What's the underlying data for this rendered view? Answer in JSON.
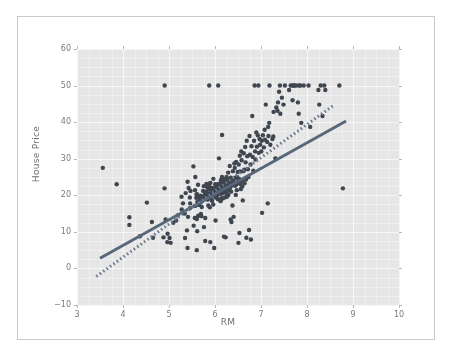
{
  "figure": {
    "background_color": "#ffffff",
    "frame_border_color": "#c9c9c9",
    "plot_background_color": "#e6e6e6",
    "gridline_color": "#f2f2f2",
    "tick_label_color": "#7a7a7a",
    "axis_label_color": "#6d6d6d"
  },
  "chart_data": {
    "type": "scatter",
    "title": "",
    "xlabel": "RM",
    "ylabel": "House Price",
    "xlim": [
      3,
      10
    ],
    "ylim": [
      -10,
      60
    ],
    "xticks": [
      3,
      4,
      5,
      6,
      7,
      8,
      9,
      10
    ],
    "yticks": [
      -10,
      0,
      10,
      20,
      30,
      40,
      50,
      60
    ],
    "xtick_labels": [
      "3",
      "4",
      "5",
      "6",
      "7",
      "8",
      "9",
      "10"
    ],
    "ytick_labels": [
      "-10",
      "0",
      "10",
      "20",
      "30",
      "40",
      "50",
      "60"
    ],
    "grid": true,
    "legend": "none",
    "marker": {
      "shape": "circle",
      "color": "#3f4650",
      "size": 2.2
    },
    "series": [
      {
        "name": "observations",
        "kind": "scatter",
        "points": [
          [
            3.561,
            27.5
          ],
          [
            3.863,
            23.0
          ],
          [
            4.138,
            14.0
          ],
          [
            4.138,
            11.9
          ],
          [
            4.368,
            8.8
          ],
          [
            4.519,
            18.0
          ],
          [
            4.628,
            12.7
          ],
          [
            4.652,
            8.4
          ],
          [
            4.88,
            8.5
          ],
          [
            4.903,
            21.9
          ],
          [
            4.906,
            50.0
          ],
          [
            4.926,
            13.4
          ],
          [
            4.963,
            7.2
          ],
          [
            4.97,
            9.5
          ],
          [
            5.012,
            8.3
          ],
          [
            5.036,
            7.0
          ],
          [
            5.093,
            12.5
          ],
          [
            5.155,
            13.1
          ],
          [
            5.19,
            14.5
          ],
          [
            5.272,
            19.6
          ],
          [
            5.277,
            16.1
          ],
          [
            5.304,
            17.8
          ],
          [
            5.344,
            15.0
          ],
          [
            5.349,
            8.3
          ],
          [
            5.362,
            20.6
          ],
          [
            5.39,
            10.4
          ],
          [
            5.403,
            5.6
          ],
          [
            5.404,
            23.7
          ],
          [
            5.414,
            14.1
          ],
          [
            5.427,
            22.0
          ],
          [
            5.453,
            19.4
          ],
          [
            5.456,
            16.5
          ],
          [
            5.46,
            17.8
          ],
          [
            5.468,
            21.2
          ],
          [
            5.531,
            27.9
          ],
          [
            5.536,
            11.7
          ],
          [
            5.56,
            13.8
          ],
          [
            5.565,
            21.4
          ],
          [
            5.569,
            17.1
          ],
          [
            5.572,
            25.0
          ],
          [
            5.593,
            19.3
          ],
          [
            5.599,
            20.2
          ],
          [
            5.602,
            13.9
          ],
          [
            5.604,
            5.0
          ],
          [
            5.605,
            13.5
          ],
          [
            5.608,
            20.3
          ],
          [
            5.613,
            10.2
          ],
          [
            5.617,
            18.2
          ],
          [
            5.627,
            19.4
          ],
          [
            5.631,
            22.9
          ],
          [
            5.637,
            14.4
          ],
          [
            5.647,
            17.4
          ],
          [
            5.66,
            17.4
          ],
          [
            5.682,
            18.9
          ],
          [
            5.683,
            19.9
          ],
          [
            5.693,
            14.9
          ],
          [
            5.701,
            18.2
          ],
          [
            5.705,
            14.3
          ],
          [
            5.708,
            19.6
          ],
          [
            5.713,
            16.8
          ],
          [
            5.727,
            18.5
          ],
          [
            5.736,
            19.1
          ],
          [
            5.741,
            21.2
          ],
          [
            5.757,
            22.5
          ],
          [
            5.76,
            11.3
          ],
          [
            5.762,
            19.8
          ],
          [
            5.786,
            20.4
          ],
          [
            5.787,
            7.5
          ],
          [
            5.789,
            13.8
          ],
          [
            5.794,
            19.0
          ],
          [
            5.8,
            20.5
          ],
          [
            5.803,
            21.0
          ],
          [
            5.813,
            23.1
          ],
          [
            5.817,
            20.1
          ],
          [
            5.834,
            22.2
          ],
          [
            5.837,
            18.8
          ],
          [
            5.854,
            17.2
          ],
          [
            5.856,
            21.7
          ],
          [
            5.868,
            19.3
          ],
          [
            5.872,
            22.6
          ],
          [
            5.874,
            50.0
          ],
          [
            5.876,
            20.6
          ],
          [
            5.879,
            23.2
          ],
          [
            5.885,
            21.7
          ],
          [
            5.888,
            16.7
          ],
          [
            5.891,
            19.5
          ],
          [
            5.895,
            20.1
          ],
          [
            5.898,
            7.2
          ],
          [
            5.9,
            23.4
          ],
          [
            5.914,
            20.6
          ],
          [
            5.926,
            18.7
          ],
          [
            5.935,
            22.0
          ],
          [
            5.936,
            18.5
          ],
          [
            5.949,
            21.4
          ],
          [
            5.951,
            20.9
          ],
          [
            5.96,
            19.9
          ],
          [
            5.961,
            21.2
          ],
          [
            5.962,
            17.5
          ],
          [
            5.963,
            21.0
          ],
          [
            5.965,
            24.5
          ],
          [
            5.976,
            21.8
          ],
          [
            5.983,
            5.6
          ],
          [
            5.987,
            20.3
          ],
          [
            6.003,
            20.5
          ],
          [
            6.004,
            23.0
          ],
          [
            6.006,
            22.0
          ],
          [
            6.009,
            20.9
          ],
          [
            6.012,
            13.1
          ],
          [
            6.015,
            19.4
          ],
          [
            6.02,
            21.6
          ],
          [
            6.023,
            22.9
          ],
          [
            6.03,
            19.5
          ],
          [
            6.04,
            21.0
          ],
          [
            6.047,
            20.0
          ],
          [
            6.059,
            21.7
          ],
          [
            6.064,
            18.9
          ],
          [
            6.065,
            22.1
          ],
          [
            6.07,
            50.0
          ],
          [
            6.078,
            23.1
          ],
          [
            6.082,
            20.4
          ],
          [
            6.086,
            30.1
          ],
          [
            6.092,
            21.9
          ],
          [
            6.096,
            22.3
          ],
          [
            6.108,
            20.6
          ],
          [
            6.114,
            21.4
          ],
          [
            6.121,
            18.4
          ],
          [
            6.127,
            23.3
          ],
          [
            6.129,
            24.2
          ],
          [
            6.13,
            22.2
          ],
          [
            6.137,
            20.4
          ],
          [
            6.14,
            19.2
          ],
          [
            6.142,
            22.8
          ],
          [
            6.145,
            21.1
          ],
          [
            6.152,
            25.0
          ],
          [
            6.154,
            36.5
          ],
          [
            6.162,
            19.1
          ],
          [
            6.167,
            22.0
          ],
          [
            6.172,
            20.7
          ],
          [
            6.174,
            23.8
          ],
          [
            6.182,
            21.2
          ],
          [
            6.185,
            24.4
          ],
          [
            6.19,
            20.9
          ],
          [
            6.193,
            22.6
          ],
          [
            6.195,
            8.7
          ],
          [
            6.2,
            21.9
          ],
          [
            6.208,
            23.1
          ],
          [
            6.211,
            19.4
          ],
          [
            6.216,
            22.4
          ],
          [
            6.219,
            20.8
          ],
          [
            6.224,
            24.0
          ],
          [
            6.229,
            21.5
          ],
          [
            6.232,
            8.5
          ],
          [
            6.24,
            23.3
          ],
          [
            6.245,
            22.1
          ],
          [
            6.25,
            25.0
          ],
          [
            6.254,
            20.6
          ],
          [
            6.258,
            19.6
          ],
          [
            6.263,
            22.4
          ],
          [
            6.268,
            21.8
          ],
          [
            6.273,
            23.9
          ],
          [
            6.279,
            22.0
          ],
          [
            6.286,
            26.2
          ],
          [
            6.29,
            20.1
          ],
          [
            6.297,
            24.4
          ],
          [
            6.302,
            23.1
          ],
          [
            6.312,
            22.5
          ],
          [
            6.315,
            21.4
          ],
          [
            6.32,
            28.0
          ],
          [
            6.326,
            23.7
          ],
          [
            6.333,
            22.2
          ],
          [
            6.34,
            13.4
          ],
          [
            6.345,
            24.8
          ],
          [
            6.35,
            21.0
          ],
          [
            6.358,
            12.7
          ],
          [
            6.362,
            23.5
          ],
          [
            6.372,
            22.8
          ],
          [
            6.38,
            17.2
          ],
          [
            6.389,
            26.6
          ],
          [
            6.395,
            24.1
          ],
          [
            6.402,
            22.9
          ],
          [
            6.405,
            14.1
          ],
          [
            6.416,
            23.3
          ],
          [
            6.421,
            28.7
          ],
          [
            6.431,
            27.5
          ],
          [
            6.437,
            22.6
          ],
          [
            6.442,
            24.8
          ],
          [
            6.452,
            20.1
          ],
          [
            6.46,
            29.1
          ],
          [
            6.47,
            23.0
          ],
          [
            6.474,
            21.4
          ],
          [
            6.482,
            25.0
          ],
          [
            6.492,
            26.4
          ],
          [
            6.501,
            23.9
          ],
          [
            6.51,
            7.0
          ],
          [
            6.516,
            28.4
          ],
          [
            6.525,
            24.5
          ],
          [
            6.531,
            9.7
          ],
          [
            6.54,
            30.8
          ],
          [
            6.545,
            26.5
          ],
          [
            6.552,
            23.1
          ],
          [
            6.563,
            21.7
          ],
          [
            6.57,
            32.0
          ],
          [
            6.579,
            29.6
          ],
          [
            6.585,
            24.0
          ],
          [
            6.593,
            22.4
          ],
          [
            6.604,
            18.6
          ],
          [
            6.616,
            26.6
          ],
          [
            6.625,
            31.5
          ],
          [
            6.635,
            27.0
          ],
          [
            6.642,
            23.3
          ],
          [
            6.656,
            33.2
          ],
          [
            6.665,
            29.0
          ],
          [
            6.673,
            24.3
          ],
          [
            6.682,
            8.4
          ],
          [
            6.69,
            34.9
          ],
          [
            6.701,
            30.7
          ],
          [
            6.715,
            27.1
          ],
          [
            6.728,
            25.0
          ],
          [
            6.74,
            10.5
          ],
          [
            6.75,
            36.2
          ],
          [
            6.76,
            31.1
          ],
          [
            6.772,
            28.4
          ],
          [
            6.78,
            7.9
          ],
          [
            6.794,
            33.4
          ],
          [
            6.81,
            41.7
          ],
          [
            6.82,
            30.5
          ],
          [
            6.833,
            26.7
          ],
          [
            6.849,
            34.9
          ],
          [
            6.861,
            50.0
          ],
          [
            6.871,
            32.0
          ],
          [
            6.88,
            29.8
          ],
          [
            6.898,
            37.2
          ],
          [
            6.91,
            33.3
          ],
          [
            6.93,
            36.4
          ],
          [
            6.943,
            50.0
          ],
          [
            6.951,
            31.6
          ],
          [
            6.968,
            35.4
          ],
          [
            6.98,
            33.8
          ],
          [
            7.007,
            32.0
          ],
          [
            7.016,
            34.9
          ],
          [
            7.024,
            15.2
          ],
          [
            7.041,
            36.4
          ],
          [
            7.061,
            33.1
          ],
          [
            7.079,
            37.9
          ],
          [
            7.088,
            35.2
          ],
          [
            7.104,
            44.8
          ],
          [
            7.135,
            34.6
          ],
          [
            7.147,
            17.8
          ],
          [
            7.155,
            38.7
          ],
          [
            7.163,
            36.2
          ],
          [
            7.178,
            39.8
          ],
          [
            7.185,
            50.0
          ],
          [
            7.203,
            33.8
          ],
          [
            7.249,
            35.4
          ],
          [
            7.267,
            36.1
          ],
          [
            7.274,
            42.8
          ],
          [
            7.313,
            30.1
          ],
          [
            7.333,
            44.0
          ],
          [
            7.358,
            43.1
          ],
          [
            7.37,
            45.4
          ],
          [
            7.393,
            48.3
          ],
          [
            7.412,
            50.0
          ],
          [
            7.42,
            42.3
          ],
          [
            7.454,
            46.7
          ],
          [
            7.489,
            44.8
          ],
          [
            7.52,
            50.0
          ],
          [
            7.61,
            48.8
          ],
          [
            7.645,
            50.0
          ],
          [
            7.686,
            46.0
          ],
          [
            7.691,
            50.0
          ],
          [
            7.716,
            50.0
          ],
          [
            7.72,
            50.0
          ],
          [
            7.765,
            50.0
          ],
          [
            7.802,
            45.4
          ],
          [
            7.82,
            42.3
          ],
          [
            7.831,
            50.0
          ],
          [
            7.853,
            50.0
          ],
          [
            7.875,
            39.8
          ],
          [
            7.929,
            50.0
          ],
          [
            8.034,
            50.0
          ],
          [
            8.069,
            38.7
          ],
          [
            8.247,
            48.8
          ],
          [
            8.266,
            44.8
          ],
          [
            8.297,
            50.0
          ],
          [
            8.337,
            41.7
          ],
          [
            8.375,
            50.0
          ],
          [
            8.398,
            48.8
          ],
          [
            8.704,
            50.0
          ],
          [
            8.78,
            21.9
          ]
        ]
      },
      {
        "name": "fit-line-solid",
        "kind": "line",
        "style": "solid",
        "color": "#59677a",
        "width": 3,
        "endpoints": [
          [
            3.5,
            2.8
          ],
          [
            8.85,
            40.3
          ]
        ]
      },
      {
        "name": "fit-line-dotted",
        "kind": "line",
        "style": "dotted",
        "color": "#6b7a8c",
        "width": 3,
        "endpoints": [
          [
            3.42,
            -2.2
          ],
          [
            8.6,
            44.8
          ]
        ]
      }
    ]
  }
}
